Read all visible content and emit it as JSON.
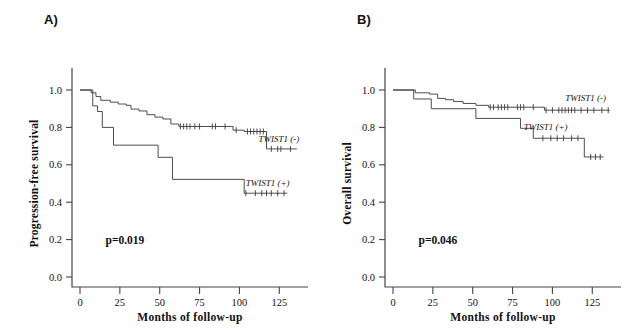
{
  "figure": {
    "panels": [
      {
        "letter": "A)",
        "ylabel": "Progression-free survival",
        "xlabel": "Months of follow-up",
        "pvalue": "p=0.019",
        "label_neg": "TWIST1 (-)",
        "label_pos": "TWIST1 (+)"
      },
      {
        "letter": "B)",
        "ylabel": "Overall survival",
        "xlabel": "Months of follow-up",
        "pvalue": "p=0.046",
        "label_neg": "TWIST1 (-)",
        "label_pos": "TWIST1 (+)"
      }
    ]
  },
  "chart_data": [
    {
      "type": "line",
      "title": "A) Progression-free survival by TWIST1 status",
      "xlabel": "Months of follow-up",
      "ylabel": "Progression-free survival",
      "xlim": [
        0,
        138
      ],
      "ylim": [
        0.0,
        1.0
      ],
      "xticks": [
        0,
        25,
        50,
        75,
        100,
        125
      ],
      "yticks": [
        0.0,
        0.2,
        0.4,
        0.6,
        0.8,
        1.0
      ],
      "grid": false,
      "annotations": [
        "p=0.019"
      ],
      "legend": [
        "TWIST1 (-)",
        "TWIST1 (+)"
      ],
      "legend_position": "inline-right",
      "series": [
        {
          "name": "TWIST1 (-)",
          "steps": [
            [
              0,
              1.0
            ],
            [
              7,
              1.0
            ],
            [
              7,
              0.985
            ],
            [
              10,
              0.985
            ],
            [
              10,
              0.965
            ],
            [
              13,
              0.965
            ],
            [
              13,
              0.945
            ],
            [
              19,
              0.945
            ],
            [
              19,
              0.935
            ],
            [
              24,
              0.935
            ],
            [
              24,
              0.925
            ],
            [
              29,
              0.925
            ],
            [
              29,
              0.918
            ],
            [
              32,
              0.918
            ],
            [
              32,
              0.898
            ],
            [
              37,
              0.898
            ],
            [
              37,
              0.888
            ],
            [
              42,
              0.888
            ],
            [
              42,
              0.868
            ],
            [
              47,
              0.868
            ],
            [
              47,
              0.855
            ],
            [
              52,
              0.855
            ],
            [
              52,
              0.845
            ],
            [
              57,
              0.845
            ],
            [
              57,
              0.818
            ],
            [
              62,
              0.818
            ],
            [
              62,
              0.805
            ],
            [
              96,
              0.805
            ],
            [
              96,
              0.785
            ],
            [
              103,
              0.785
            ],
            [
              103,
              0.778
            ],
            [
              117,
              0.778
            ],
            [
              117,
              0.685
            ],
            [
              136,
              0.685
            ]
          ],
          "censor_x": [
            63,
            65,
            67,
            69,
            72,
            75,
            83,
            85,
            91,
            98,
            105,
            107,
            109,
            111,
            113,
            115,
            120,
            124,
            126,
            132
          ],
          "censor_y": [
            0.805,
            0.805,
            0.805,
            0.805,
            0.805,
            0.805,
            0.805,
            0.805,
            0.805,
            0.785,
            0.778,
            0.778,
            0.778,
            0.778,
            0.778,
            0.778,
            0.685,
            0.685,
            0.685,
            0.685
          ]
        },
        {
          "name": "TWIST1 (+)",
          "steps": [
            [
              0,
              1.0
            ],
            [
              8,
              1.0
            ],
            [
              8,
              0.915
            ],
            [
              11,
              0.915
            ],
            [
              11,
              0.885
            ],
            [
              14,
              0.885
            ],
            [
              14,
              0.8
            ],
            [
              21,
              0.8
            ],
            [
              21,
              0.705
            ],
            [
              49,
              0.705
            ],
            [
              49,
              0.64
            ],
            [
              58,
              0.64
            ],
            [
              58,
              0.522
            ],
            [
              103,
              0.522
            ],
            [
              103,
              0.448
            ],
            [
              130,
              0.448
            ]
          ],
          "censor_x": [
            104,
            110,
            114,
            117,
            120,
            124,
            128
          ],
          "censor_y": [
            0.448,
            0.448,
            0.448,
            0.448,
            0.448,
            0.448,
            0.448
          ]
        }
      ]
    },
    {
      "type": "line",
      "title": "B) Overall survival by TWIST1 status",
      "xlabel": "Months of follow-up",
      "ylabel": "Overall survival",
      "xlim": [
        0,
        138
      ],
      "ylim": [
        0.0,
        1.0
      ],
      "xticks": [
        0,
        25,
        50,
        75,
        100,
        125
      ],
      "yticks": [
        0.0,
        0.2,
        0.4,
        0.6,
        0.8,
        1.0
      ],
      "grid": false,
      "annotations": [
        "p=0.046"
      ],
      "legend": [
        "TWIST1 (-)",
        "TWIST1 (+)"
      ],
      "legend_position": "inline-right",
      "series": [
        {
          "name": "TWIST1 (-)",
          "steps": [
            [
              0,
              1.0
            ],
            [
              14,
              1.0
            ],
            [
              14,
              0.985
            ],
            [
              23,
              0.985
            ],
            [
              23,
              0.978
            ],
            [
              28,
              0.978
            ],
            [
              28,
              0.955
            ],
            [
              33,
              0.955
            ],
            [
              33,
              0.948
            ],
            [
              38,
              0.948
            ],
            [
              38,
              0.938
            ],
            [
              44,
              0.938
            ],
            [
              44,
              0.928
            ],
            [
              52,
              0.928
            ],
            [
              52,
              0.918
            ],
            [
              60,
              0.918
            ],
            [
              60,
              0.908
            ],
            [
              95,
              0.908
            ],
            [
              95,
              0.892
            ],
            [
              136,
              0.892
            ]
          ],
          "censor_x": [
            61,
            63,
            66,
            68,
            70,
            72,
            78,
            80,
            82,
            88,
            96,
            100,
            104,
            106,
            108,
            110,
            112,
            114,
            118,
            122,
            126,
            131,
            135
          ],
          "censor_y": [
            0.908,
            0.908,
            0.908,
            0.908,
            0.908,
            0.908,
            0.908,
            0.908,
            0.908,
            0.908,
            0.892,
            0.892,
            0.892,
            0.892,
            0.892,
            0.892,
            0.892,
            0.892,
            0.892,
            0.892,
            0.892,
            0.892,
            0.892
          ]
        },
        {
          "name": "TWIST1 (+)",
          "steps": [
            [
              0,
              1.0
            ],
            [
              13,
              1.0
            ],
            [
              13,
              0.952
            ],
            [
              24,
              0.952
            ],
            [
              24,
              0.9
            ],
            [
              52,
              0.9
            ],
            [
              52,
              0.848
            ],
            [
              80,
              0.848
            ],
            [
              80,
              0.795
            ],
            [
              88,
              0.795
            ],
            [
              88,
              0.742
            ],
            [
              120,
              0.742
            ],
            [
              120,
              0.642
            ],
            [
              132,
              0.642
            ]
          ],
          "censor_x": [
            94,
            99,
            103,
            107,
            112,
            116,
            124,
            127,
            130
          ],
          "censor_y": [
            0.742,
            0.742,
            0.742,
            0.742,
            0.742,
            0.742,
            0.642,
            0.642,
            0.642
          ]
        }
      ]
    }
  ]
}
